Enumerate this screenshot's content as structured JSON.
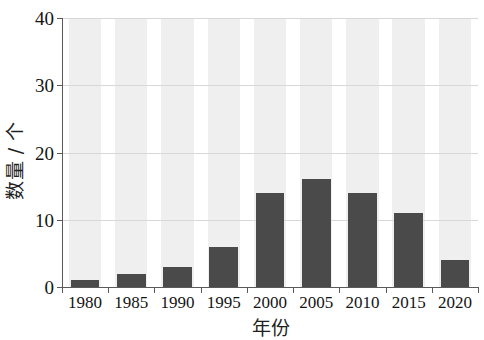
{
  "chart_data": {
    "type": "bar",
    "title": "",
    "subtitle": "",
    "xlabel": "年份",
    "ylabel": "数量 / 个",
    "categories": [
      "1980",
      "1985",
      "1990",
      "1995",
      "2000",
      "2005",
      "2010",
      "2015",
      "2020"
    ],
    "values": [
      1,
      2,
      3,
      6,
      14,
      16,
      14,
      11,
      4
    ],
    "series": [
      {
        "name": "数量",
        "values": [
          1,
          2,
          3,
          6,
          14,
          16,
          14,
          11,
          4
        ]
      }
    ],
    "ylim": [
      0,
      40
    ],
    "xlim": [
      0,
      9
    ],
    "y_ticks": [
      0,
      10,
      20,
      30,
      40
    ],
    "y_tick_labels": [
      "0",
      "10",
      "20",
      "30",
      "40"
    ],
    "x_tick_labels": [
      "1980",
      "1985",
      "1990",
      "1995",
      "2000",
      "2005",
      "2010",
      "2015",
      "2020"
    ],
    "grid": true,
    "grid_axis": "y",
    "legend": false,
    "legend_position": "none",
    "annotations": [],
    "colors": {
      "bar": "#4a4a4a",
      "band": "#efefef",
      "grid": "#d8d8d8",
      "axis": "#5a5a5a",
      "text": "#141414",
      "background": "#ffffff"
    }
  }
}
